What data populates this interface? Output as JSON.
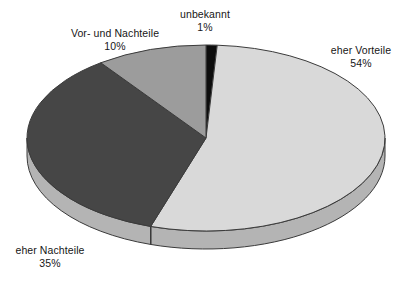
{
  "chart_data": {
    "type": "pie",
    "title": "",
    "subtitle": "",
    "xlabel": "",
    "ylabel": "",
    "legend_position": "none",
    "grid": false,
    "three_d": true,
    "start_angle_deg": 0,
    "direction": "clockwise",
    "categories": [
      "unbekannt",
      "eher Vorteile",
      "eher Nachteile",
      "Vor- und Nachteile"
    ],
    "values": [
      1,
      54,
      35,
      10
    ],
    "value_suffix": "%",
    "slices": [
      {
        "label": "unbekannt",
        "value": 1,
        "display": "1%",
        "color": "#0d0d0d",
        "side_color": "#0d0d0d"
      },
      {
        "label": "eher Vorteile",
        "value": 54,
        "display": "54%",
        "color": "#d9d9d9",
        "side_color": "#b4b4b4"
      },
      {
        "label": "eher Nachteile",
        "value": 35,
        "display": "35%",
        "color": "#464646",
        "side_color": "#b4b4b4"
      },
      {
        "label": "Vor- und Nachteile",
        "value": 10,
        "display": "10%",
        "color": "#9c9c9c",
        "side_color": "#9c9c9c"
      }
    ],
    "annotations": []
  },
  "labels": {
    "unbekannt": {
      "name": "unbekannt",
      "pct": "1%"
    },
    "vorteile": {
      "name": "eher Vorteile",
      "pct": "54%"
    },
    "nachteile": {
      "name": "eher Nachteile",
      "pct": "35%"
    },
    "vorund": {
      "name": "Vor- und Nachteile",
      "pct": "10%"
    }
  },
  "colors": {
    "background": "#ffffff",
    "outline": "#3b3b3b",
    "text": "#161616",
    "light_gray": "#d9d9d9",
    "medium_gray": "#9c9c9c",
    "dark_gray": "#464646",
    "black_slice": "#0d0d0d",
    "side_wall": "#b4b4b4"
  }
}
